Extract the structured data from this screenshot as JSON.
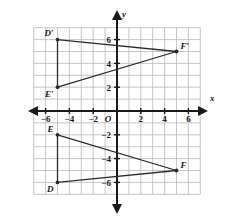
{
  "figure": {
    "axis_labels": {
      "x": "x",
      "y": "y",
      "origin": "O"
    },
    "grid": {
      "x_min": -7,
      "x_max": 7,
      "y_min": -7,
      "y_max": 7,
      "cell_size": 1,
      "show_grid": true,
      "grid_color": "#b9b9b9",
      "axis_color": "#1a1a1a",
      "shape_color": "#2b2b2b"
    },
    "x_ticks": [
      {
        "value": -6,
        "label": "−6"
      },
      {
        "value": -4,
        "label": "−4"
      },
      {
        "value": -2,
        "label": "−2"
      },
      {
        "value": 2,
        "label": "2"
      },
      {
        "value": 4,
        "label": "4"
      },
      {
        "value": 6,
        "label": "6"
      }
    ],
    "y_ticks": [
      {
        "value": 6,
        "label": "6"
      },
      {
        "value": 4,
        "label": "4"
      },
      {
        "value": 2,
        "label": "2"
      },
      {
        "value": -2,
        "label": "−2"
      },
      {
        "value": -4,
        "label": "−4"
      },
      {
        "value": -6,
        "label": "−6"
      }
    ],
    "shapes": [
      {
        "name": "triangle-def",
        "vertices": [
          {
            "label": "D",
            "x": -5,
            "y": -6
          },
          {
            "label": "E",
            "x": -5,
            "y": -2
          },
          {
            "label": "F",
            "x": 5,
            "y": -5
          }
        ]
      },
      {
        "name": "triangle-d-prime-e-prime-f-prime",
        "vertices": [
          {
            "label": "D′",
            "x": -5,
            "y": 6
          },
          {
            "label": "E′",
            "x": -5,
            "y": 2
          },
          {
            "label": "F′",
            "x": 5,
            "y": 5
          }
        ]
      }
    ]
  }
}
